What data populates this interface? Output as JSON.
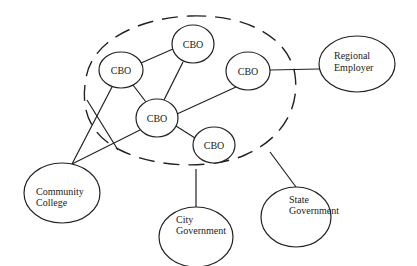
{
  "diagram": {
    "type": "network",
    "boundary": {
      "style": "dashed",
      "shape": "ellipse",
      "label": ""
    },
    "nodes": [
      {
        "id": "cbo1",
        "label": [
          "CBO"
        ],
        "cx": 121,
        "cy": 70,
        "rx": 22,
        "ry": 18
      },
      {
        "id": "cbo2",
        "label": [
          "CBO"
        ],
        "cx": 193,
        "cy": 44,
        "rx": 21,
        "ry": 19
      },
      {
        "id": "cbo3",
        "label": [
          "CBO"
        ],
        "cx": 248,
        "cy": 71,
        "rx": 22,
        "ry": 19
      },
      {
        "id": "cbo4",
        "label": [
          "CBO"
        ],
        "cx": 157,
        "cy": 118,
        "rx": 21,
        "ry": 19
      },
      {
        "id": "cbo5",
        "label": [
          "CBO"
        ],
        "cx": 214,
        "cy": 145,
        "rx": 21,
        "ry": 18
      },
      {
        "id": "regional-employer",
        "label": [
          "Regional",
          "Employer"
        ],
        "cx": 357,
        "cy": 64,
        "rx": 38,
        "ry": 28
      },
      {
        "id": "community-college",
        "label": [
          "Community",
          "College"
        ],
        "cx": 62,
        "cy": 193,
        "rx": 38,
        "ry": 30
      },
      {
        "id": "city-government",
        "label": [
          "City",
          "Government"
        ],
        "cx": 196,
        "cy": 237,
        "rx": 37,
        "ry": 30
      },
      {
        "id": "state-government",
        "label": [
          "State",
          "Government"
        ],
        "cx": 296,
        "cy": 217,
        "rx": 35,
        "ry": 30
      }
    ],
    "edges": [
      {
        "from": "cbo1",
        "to": "cbo2"
      },
      {
        "from": "cbo1",
        "to": "cbo4"
      },
      {
        "from": "cbo2",
        "to": "cbo4"
      },
      {
        "from": "cbo3",
        "to": "cbo4"
      },
      {
        "from": "cbo4",
        "to": "cbo5"
      },
      {
        "from": "cbo3",
        "to": "regional-employer"
      },
      {
        "from": "cbo1",
        "to": "community-college"
      },
      {
        "from": "cbo4",
        "to": "community-college"
      },
      {
        "from": "boundary",
        "to": "city-government"
      },
      {
        "from": "boundary",
        "to": "state-government"
      }
    ]
  },
  "labels": {
    "cbo1": "CBO",
    "cbo2": "CBO",
    "cbo3": "CBO",
    "cbo4": "CBO",
    "cbo5": "CBO",
    "regional_employer_1": "Regional",
    "regional_employer_2": "Employer",
    "community_college_1": "Community",
    "community_college_2": "College",
    "city_government_1": "City",
    "city_government_2": "Government",
    "state_government_1": "State",
    "state_government_2": "Government"
  }
}
